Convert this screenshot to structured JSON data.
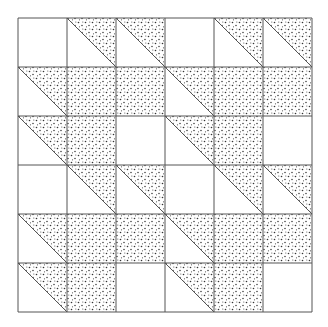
{
  "figure": {
    "grid": {
      "rows": 6,
      "cols": 6,
      "origin_x": 18,
      "origin_y": 18,
      "cell": 49
    },
    "colors": {
      "line": "#555555",
      "dot": "#333333",
      "background": "#ffffff"
    },
    "block_pattern": [
      [
        "empty",
        "ur",
        "ur"
      ],
      [
        "ur",
        "full",
        "full"
      ],
      [
        "ur",
        "full",
        "empty"
      ]
    ]
  }
}
